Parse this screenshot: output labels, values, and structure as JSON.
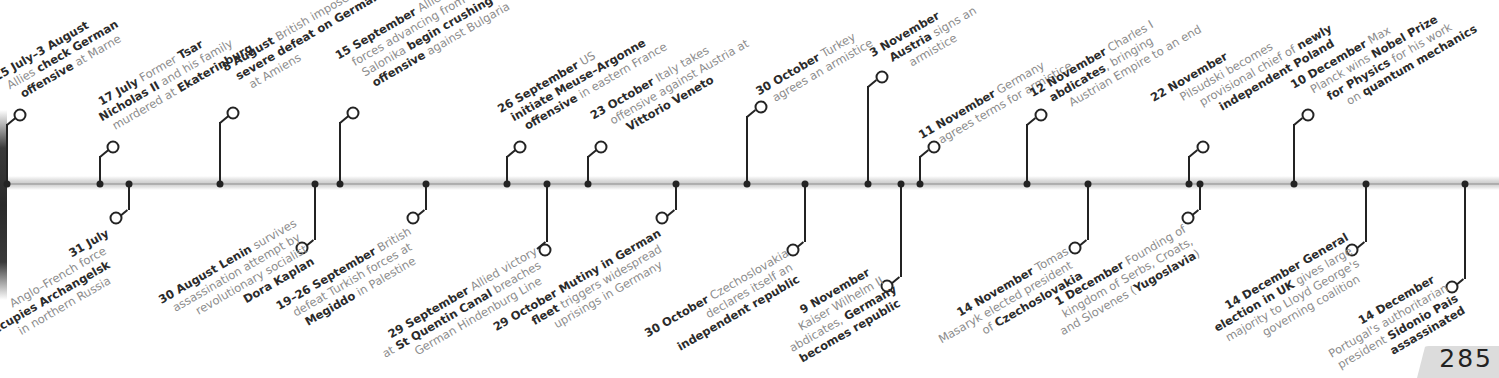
{
  "page": {
    "number": "285"
  },
  "timeline": {
    "bar_color": "#c9c9c9",
    "marker_color": "#232323",
    "bold_color": "#2b2b2b",
    "text_color": "#8c8c8c"
  },
  "top_events": [
    {
      "date": "15 July–3 August",
      "lines": [
        [
          "",
          "Allies "
        ],
        [
          "b",
          "check German"
        ],
        [
          "n",
          ""
        ],
        [
          "b",
          "offensive"
        ],
        [
          "",
          " at Marne"
        ]
      ],
      "l1": {
        "bold": "15 July–3 August",
        "text": ""
      },
      "l2": {
        "pre": "Allies ",
        "bold": "check German",
        "post": ""
      },
      "l3": {
        "pre": "",
        "bold": "offensive",
        "post": " at Marne"
      }
    },
    {
      "date": "17 July",
      "l1": {
        "bold": "17 July",
        "text": " Former "
      },
      "l1b": "Tsar",
      "l2": {
        "pre": "",
        "bold": "Nicholas II",
        "post": " and his family"
      },
      "l3": {
        "pre": "murdered at ",
        "bold": "Ekaterinburg",
        "post": ""
      }
    },
    {
      "date": "8 August",
      "l1": {
        "bold": "8 August",
        "text": " British impose"
      },
      "l2": {
        "pre": "",
        "bold": "severe defeat on Germans",
        "post": ""
      },
      "l3": {
        "pre": "at Amiens",
        "bold": "",
        "post": ""
      }
    },
    {
      "date": "15 September",
      "l1": {
        "bold": "15 September",
        "text": " Allied"
      },
      "l2": {
        "pre": "forces advancing from",
        "bold": "",
        "post": ""
      },
      "l3": {
        "pre": "Salonika ",
        "bold": "begin crushing",
        "post": ""
      },
      "l4": {
        "pre": "",
        "bold": "offensive",
        "post": " against Bulgaria"
      }
    },
    {
      "date": "26 September",
      "l1": {
        "bold": "26 September",
        "text": " US"
      },
      "l2": {
        "pre": "",
        "bold": "initiate Meuse–Argonne",
        "post": ""
      },
      "l3": {
        "pre": "",
        "bold": "offensive",
        "post": " in eastern France"
      }
    },
    {
      "date": "23 October",
      "l1": {
        "bold": "23 October",
        "text": " Italy takes"
      },
      "l2": {
        "pre": "offensive against Austria at",
        "bold": "",
        "post": ""
      },
      "l3": {
        "pre": "",
        "bold": "Vittorio Veneto",
        "post": ""
      }
    },
    {
      "date": "30 October",
      "l1": {
        "bold": "30 October",
        "text": " Turkey"
      },
      "l2": {
        "pre": "agrees an armistice",
        "bold": "",
        "post": ""
      }
    },
    {
      "date": "3 November",
      "l1": {
        "bold": "3 November",
        "text": ""
      },
      "l2": {
        "pre": "",
        "bold": "Austria",
        "post": " signs an"
      },
      "l3": {
        "pre": "armistice",
        "bold": "",
        "post": ""
      }
    },
    {
      "date": "11 November",
      "l1": {
        "bold": "11 November",
        "text": " Germany"
      },
      "l2": {
        "pre": "agrees terms for armistice",
        "bold": "",
        "post": ""
      }
    },
    {
      "date": "12 November",
      "l1": {
        "bold": "12 November",
        "text": " Charles I"
      },
      "l2": {
        "pre": "",
        "bold": "abdicates",
        "post": ", bringing"
      },
      "l3": {
        "pre": "Austrian Empire to an end",
        "bold": "",
        "post": ""
      }
    },
    {
      "date": "22 November",
      "l1": {
        "bold": "22 November",
        "text": ""
      },
      "l2": {
        "pre": "Pilsudski becomes",
        "bold": "",
        "post": ""
      },
      "l3": {
        "pre": "provisional chief of ",
        "bold": "newly",
        "post": ""
      },
      "l4": {
        "pre": "",
        "bold": "independent Poland",
        "post": ""
      }
    },
    {
      "date": "10 December",
      "l1": {
        "bold": "10 December",
        "text": " Max"
      },
      "l2": {
        "pre": "Planck wins ",
        "bold": "Nobel Prize",
        "post": ""
      },
      "l3": {
        "pre": "",
        "bold": "for Physics",
        "post": " for his work"
      },
      "l4": {
        "pre": "on ",
        "bold": "quantum mechanics",
        "post": ""
      }
    }
  ],
  "bottom_events": [
    {
      "date": "31 July",
      "l1": {
        "bold": "31 July",
        "text": ""
      },
      "l2": {
        "pre": "Anglo–French force",
        "bold": "",
        "post": ""
      },
      "l3": {
        "pre": "",
        "bold": "occupies Archangelsk",
        "post": ""
      },
      "l4": {
        "pre": "in northern Russia",
        "bold": "",
        "post": ""
      }
    },
    {
      "date": "30 August",
      "l1": {
        "bold": "30 August Lenin",
        "text": " survives"
      },
      "l2": {
        "pre": "assassination attempt by",
        "bold": "",
        "post": ""
      },
      "l3": {
        "pre": "revolutionary socialist",
        "bold": "",
        "post": ""
      },
      "l4": {
        "pre": "",
        "bold": "Dora Kaplan",
        "post": ""
      }
    },
    {
      "date": "19–26 September",
      "l1": {
        "bold": "19–26 September",
        "text": " British"
      },
      "l2": {
        "pre": "defeat Turkish forces at",
        "bold": "",
        "post": ""
      },
      "l3": {
        "pre": "",
        "bold": "Megiddo",
        "post": " in Palestine"
      }
    },
    {
      "date": "29 September",
      "l1": {
        "bold": "29 September",
        "text": " Allied victory"
      },
      "l2": {
        "pre": "at ",
        "bold": "St Quentin Canal",
        "post": " breaches"
      },
      "l3": {
        "pre": "German Hindenburg Line",
        "bold": "",
        "post": ""
      }
    },
    {
      "date": "29 October",
      "l1": {
        "bold": "29 October Mutiny in German",
        "text": ""
      },
      "l2": {
        "pre": "",
        "bold": "fleet",
        "post": " triggers widespread"
      },
      "l3": {
        "pre": "uprisings in Germany",
        "bold": "",
        "post": ""
      }
    },
    {
      "date": "30 October",
      "l1": {
        "bold": "30 October",
        "text": " Czechoslovakia"
      },
      "l2": {
        "pre": "declares itself an",
        "bold": "",
        "post": ""
      },
      "l3": {
        "pre": "",
        "bold": "independent republic",
        "post": ""
      }
    },
    {
      "date": "9 November",
      "l1": {
        "bold": "9 November",
        "text": ""
      },
      "l2": {
        "pre": "Kaiser Wilhelm II",
        "bold": "",
        "post": ""
      },
      "l3": {
        "pre": "abdicates, ",
        "bold": "Germany",
        "post": ""
      },
      "l4": {
        "pre": "",
        "bold": "becomes republic",
        "post": ""
      }
    },
    {
      "date": "14 November",
      "l1": {
        "bold": "14 November",
        "text": " Tomas"
      },
      "l2": {
        "pre": "Masaryk elected president",
        "bold": "",
        "post": ""
      },
      "l3": {
        "pre": "of ",
        "bold": "Czechoslovakia",
        "post": ""
      }
    },
    {
      "date": "1 December",
      "l1": {
        "bold": "1 December",
        "text": " Founding of"
      },
      "l2": {
        "pre": "kingdom of Serbs, Croats,",
        "bold": "",
        "post": ""
      },
      "l3": {
        "pre": "and Slovenes (",
        "bold": "Yugoslavia",
        "post": ")"
      }
    },
    {
      "date": "14 December",
      "l1": {
        "bold": "14 December General",
        "text": ""
      },
      "l2": {
        "pre": "",
        "bold": "election in UK",
        "post": " gives large"
      },
      "l3": {
        "pre": "majority to Lloyd George's",
        "bold": "",
        "post": ""
      },
      "l4": {
        "pre": "governing coalition",
        "bold": "",
        "post": ""
      }
    },
    {
      "date": "14 December",
      "l1": {
        "bold": "14 December",
        "text": ""
      },
      "l2": {
        "pre": "Portugal's authoritarian",
        "bold": "",
        "post": ""
      },
      "l3": {
        "pre": "president ",
        "bold": "Sidonio Pais",
        "post": ""
      },
      "l4": {
        "pre": "",
        "bold": "assassinated",
        "post": ""
      }
    }
  ]
}
